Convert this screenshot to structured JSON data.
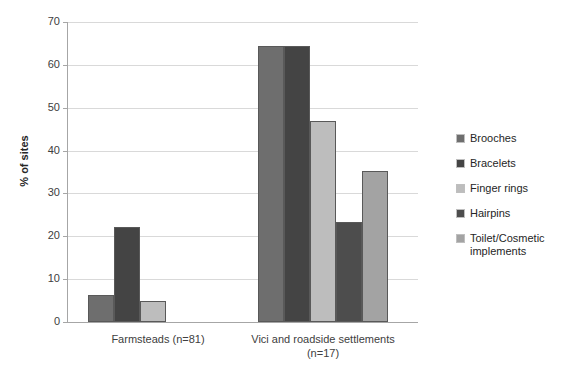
{
  "chart_data": {
    "type": "bar",
    "title": "",
    "subtitle": "",
    "xlabel": "",
    "ylabel": "% of sites",
    "ylim": [
      0,
      70
    ],
    "yticks": [
      0,
      10,
      20,
      30,
      40,
      50,
      60,
      70
    ],
    "ytick_labels": [
      "0",
      "10",
      "20",
      "30",
      "40",
      "50",
      "60",
      "70"
    ],
    "grid": true,
    "legend_position": "right",
    "categories": [
      "Farmsteads (n=81)",
      "Vici and roadside settlements (n=17)"
    ],
    "series": [
      {
        "name": "Brooches",
        "values": [
          6.2,
          64.4
        ],
        "color": "#6e6e6e"
      },
      {
        "name": "Bracelets",
        "values": [
          22.1,
          64.4
        ],
        "color": "#444444"
      },
      {
        "name": "Finger rings",
        "values": [
          4.9,
          47.0
        ],
        "color": "#bdbdbd"
      },
      {
        "name": "Hairpins",
        "values": [
          0,
          23.4
        ],
        "color": "#4d4d4d"
      },
      {
        "name": "Toilet/Cosmetic implements",
        "values": [
          0,
          35.2
        ],
        "color": "#a3a3a3"
      }
    ],
    "legend_entries": [
      "Brooches",
      "Bracelets",
      "Finger rings",
      "Hairpins",
      "Toilet/Cosmetic implements"
    ],
    "colors": {
      "gridline": "#d9d9d9",
      "axis": "#a6a6a6",
      "bar_border": "#595959",
      "text": "#404040"
    }
  }
}
